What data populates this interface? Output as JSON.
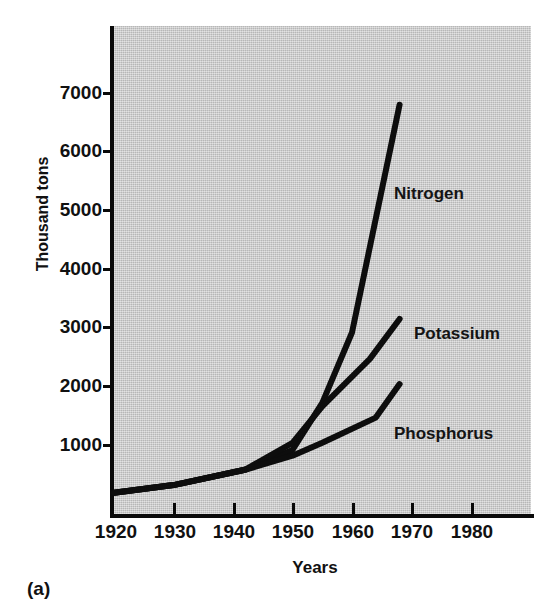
{
  "figure": {
    "panel_caption": "(a)",
    "background_color": "#c9c9c9",
    "line_color": "#0d0d0d"
  },
  "chart_data": {
    "type": "line",
    "title": "",
    "xlabel": "Years",
    "ylabel": "Thousand tons",
    "xlim": [
      1920,
      1986
    ],
    "ylim": [
      0,
      7800
    ],
    "grid": false,
    "legend_position": "inline-right-of-series",
    "xticks": [
      1920,
      1930,
      1940,
      1950,
      1960,
      1970,
      1980
    ],
    "xtick_labels": [
      "1920",
      "1930",
      "1940",
      "1950",
      "1960",
      "1970",
      "1980"
    ],
    "yticks": [
      1000,
      2000,
      3000,
      4000,
      5000,
      6000,
      7000
    ],
    "ytick_labels": [
      "1000",
      "2000",
      "3000",
      "4000",
      "5000",
      "6000",
      "7000"
    ],
    "series": [
      {
        "name": "Nitrogen",
        "label": "Nitrogen",
        "x": [
          1920,
          1930,
          1942,
          1950,
          1955,
          1960,
          1968
        ],
        "values": [
          170,
          300,
          560,
          900,
          1700,
          2900,
          6780
        ]
      },
      {
        "name": "Potassium",
        "label": "Potassium",
        "x": [
          1920,
          1930,
          1942,
          1950,
          1955,
          1963,
          1968
        ],
        "values": [
          170,
          300,
          560,
          1020,
          1640,
          2450,
          3130
        ]
      },
      {
        "name": "Phosphorus",
        "label": "Phosphorus",
        "x": [
          1920,
          1930,
          1942,
          1950,
          1955,
          1964,
          1968
        ],
        "values": [
          170,
          300,
          560,
          800,
          1020,
          1450,
          2020
        ]
      }
    ]
  },
  "series_labels": [
    {
      "text": "Nitrogen"
    },
    {
      "text": "Potassium"
    },
    {
      "text": "Phosphorus"
    }
  ]
}
